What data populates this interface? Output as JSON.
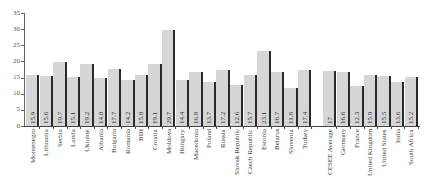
{
  "chart_data": {
    "type": "bar",
    "title": "",
    "xlabel": "",
    "ylabel": "",
    "ylim": [
      0,
      35
    ],
    "yticks": [
      0,
      5,
      10,
      15,
      20,
      25,
      30,
      35
    ],
    "grid": false,
    "legend": null,
    "value_labels": true,
    "value_label_orientation": "vertical",
    "groups": [
      {
        "name": "CESEE countries",
        "categories": [
          "Montenegro",
          "Lithuania",
          "Serbia",
          "Latvia",
          "Ukraine",
          "Albania",
          "Bulgaria",
          "Romania",
          "BIH",
          "Croatia",
          "Moldova",
          "Hungary",
          "Macedonia",
          "Poland",
          "Russia",
          "Slovak Republic",
          "Czech Republic",
          "Estonia",
          "Belarus",
          "Slovenia",
          "Turkey"
        ],
        "values": [
          15.9,
          15.6,
          19.7,
          15.1,
          19.2,
          14.8,
          17.7,
          14.2,
          15.8,
          19.1,
          29.7,
          14.4,
          16.8,
          13.7,
          17.2,
          12.6,
          15.7,
          23.1,
          16.7,
          11.8,
          17.4
        ]
      },
      {
        "name": "Comparators",
        "categories": [
          "CESEE Average",
          "Germany",
          "France",
          "United Kingdom",
          "United States",
          "India",
          "South Africa"
        ],
        "values": [
          17.0,
          16.6,
          12.3,
          15.9,
          15.5,
          13.6,
          15.2
        ]
      }
    ],
    "categories": [
      "Montenegro",
      "Lithuania",
      "Serbia",
      "Latvia",
      "Ukraine",
      "Albania",
      "Bulgaria",
      "Romania",
      "BIH",
      "Croatia",
      "Moldova",
      "Hungary",
      "Macedonia",
      "Poland",
      "Russia",
      "Slovak Republic",
      "Czech Republic",
      "Estonia",
      "Belarus",
      "Slovenia",
      "Turkey",
      "CESEE Average",
      "Germany",
      "France",
      "United Kingdom",
      "United States",
      "India",
      "South Africa"
    ],
    "values": [
      15.9,
      15.6,
      19.7,
      15.1,
      19.2,
      14.8,
      17.7,
      14.2,
      15.8,
      19.1,
      29.7,
      14.4,
      16.8,
      13.7,
      17.2,
      12.6,
      15.7,
      23.1,
      16.7,
      11.8,
      17.4,
      17.0,
      16.6,
      12.3,
      15.9,
      15.5,
      13.6,
      15.2
    ]
  },
  "colors": {
    "bar_fill": "#d6d6d6",
    "bar_edge": "#2a2a2a",
    "axis": "#555555"
  }
}
